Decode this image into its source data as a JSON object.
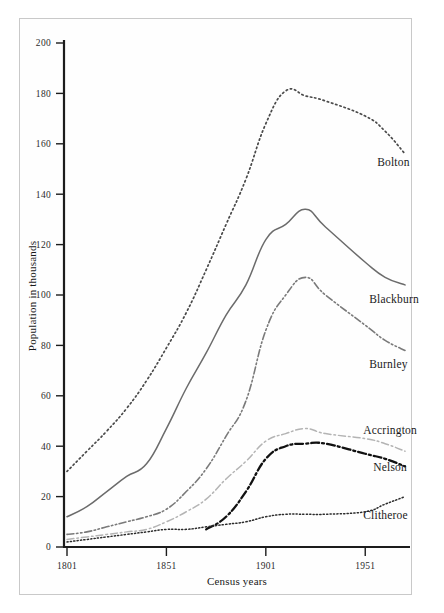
{
  "figure": {
    "background_color": "#ffffff",
    "frame_color": "#c9c9c9"
  },
  "chart_data": {
    "type": "line",
    "title": "",
    "xlabel": "Census years",
    "ylabel": "Population in thousands",
    "xlim": [
      1801,
      1971
    ],
    "ylim": [
      0,
      200
    ],
    "grid": false,
    "legend_position": "right-inline-labels",
    "x_tick_labels": [
      "1801",
      "1851",
      "1901",
      "1951"
    ],
    "x_ticks": [
      1801,
      1851,
      1901,
      1951
    ],
    "y_tick_labels": [
      "0",
      "20",
      "40",
      "60",
      "80",
      "100",
      "120",
      "140",
      "160",
      "180",
      "200"
    ],
    "y_ticks": [
      0,
      20,
      40,
      60,
      80,
      100,
      120,
      140,
      160,
      180,
      200
    ],
    "x": [
      1801,
      1811,
      1821,
      1831,
      1841,
      1851,
      1861,
      1871,
      1881,
      1891,
      1901,
      1911,
      1921,
      1931,
      1951,
      1961,
      1971
    ],
    "series": [
      {
        "name": "Bolton",
        "color": "#4a4a4a",
        "style": "dotted",
        "label_x": 1957,
        "label_y": 151,
        "values": [
          30,
          38,
          46,
          55,
          66,
          79,
          93,
          110,
          128,
          146,
          168,
          181,
          179,
          177,
          171,
          165,
          156
        ]
      },
      {
        "name": "Blackburn",
        "color": "#6b6b6b",
        "style": "solid",
        "label_x": 1953,
        "label_y": 97,
        "values": [
          12,
          16,
          22,
          28,
          33,
          47,
          63,
          77,
          92,
          104,
          122,
          128,
          134,
          127,
          113,
          107,
          104
        ]
      },
      {
        "name": "Burnley",
        "color": "#7a7a7a",
        "style": "dash-dot-dot",
        "label_x": 1953,
        "label_y": 71,
        "values": [
          5,
          6,
          8,
          10,
          12,
          15,
          22,
          31,
          44,
          58,
          86,
          100,
          107,
          100,
          88,
          82,
          78
        ]
      },
      {
        "name": "Accrington",
        "color": "#b4b4b4",
        "style": "dash-dot",
        "label_x": 1950,
        "label_y": 45,
        "values": [
          3,
          4,
          5,
          6,
          7,
          10,
          14,
          19,
          27,
          34,
          42,
          45,
          47,
          45,
          43,
          41,
          38
        ]
      },
      {
        "name": "Nelson",
        "color": "#111111",
        "style": "dash-dot-bold",
        "label_x": 1955,
        "label_y": 30,
        "values": [
          null,
          null,
          null,
          null,
          null,
          null,
          null,
          7,
          12,
          22,
          35,
          40,
          41,
          41,
          37,
          35,
          32
        ]
      },
      {
        "name": "Clitheroe",
        "color": "#2b2b2b",
        "style": "fine-dotted",
        "label_x": 1950,
        "label_y": 11,
        "values": [
          2,
          3,
          4,
          5,
          6,
          7,
          7,
          8,
          9,
          10,
          12,
          13,
          13,
          13,
          14,
          17,
          20
        ]
      }
    ]
  }
}
